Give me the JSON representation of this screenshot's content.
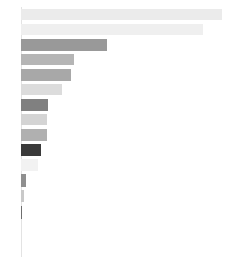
{
  "chart_data": {
    "type": "bar",
    "orientation": "horizontal",
    "title": "",
    "subtitle": "",
    "xlabel": "",
    "ylabel": "",
    "grid": false,
    "legend": null,
    "axis_line_color": "#e3e3e3",
    "background": "#ffffff",
    "xlim": [
      0,
      205
    ],
    "categories": [
      "",
      "",
      "",
      "",
      "",
      "",
      "",
      "",
      "",
      "",
      "",
      "",
      "",
      ""
    ],
    "values": [
      201,
      182,
      86,
      53,
      50,
      41,
      27,
      26,
      26,
      20,
      17,
      5,
      3,
      1
    ],
    "bars": [
      {
        "index": 1,
        "value": 201,
        "color": "#ebebeb",
        "top": 9,
        "height": 11
      },
      {
        "index": 2,
        "value": 182,
        "color": "#efefef",
        "top": 24,
        "height": 11
      },
      {
        "index": 3,
        "value": 86,
        "color": "#999999",
        "top": 39,
        "height": 12
      },
      {
        "index": 4,
        "value": 53,
        "color": "#b5b5b5",
        "top": 54,
        "height": 11
      },
      {
        "index": 5,
        "value": 50,
        "color": "#a8a8a8",
        "top": 69,
        "height": 12
      },
      {
        "index": 6,
        "value": 41,
        "color": "#dcdcdc",
        "top": 84,
        "height": 11
      },
      {
        "index": 7,
        "value": 27,
        "color": "#808080",
        "top": 99,
        "height": 12
      },
      {
        "index": 8,
        "value": 26,
        "color": "#d4d4d4",
        "top": 114,
        "height": 11
      },
      {
        "index": 9,
        "value": 26,
        "color": "#b0b0b0",
        "top": 129,
        "height": 12
      },
      {
        "index": 10,
        "value": 20,
        "color": "#3a3a3a",
        "top": 144,
        "height": 12
      },
      {
        "index": 11,
        "value": 17,
        "color": "#f2f2f2",
        "top": 159,
        "height": 12
      },
      {
        "index": 12,
        "value": 5,
        "color": "#8f8f8f",
        "top": 174,
        "height": 13
      },
      {
        "index": 13,
        "value": 3,
        "color": "#c9c9c9",
        "top": 190,
        "height": 12
      },
      {
        "index": 14,
        "value": 1,
        "color": "#6e6e6e",
        "top": 206,
        "height": 13
      }
    ]
  }
}
